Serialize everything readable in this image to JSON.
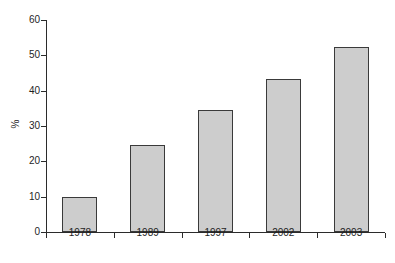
{
  "chart_data": {
    "type": "bar",
    "title": "",
    "subtitle": "",
    "xlabel": "",
    "ylabel": "%",
    "categories": [
      "1978",
      "1989",
      "1997",
      "2002",
      "2003"
    ],
    "values": [
      9.8,
      24.7,
      34.4,
      43.2,
      52.4
    ],
    "ylim": [
      0,
      60
    ],
    "ytick_values": [
      0,
      10,
      20,
      30,
      40,
      50,
      60
    ],
    "ytick_labels": [
      "0",
      "10",
      "20",
      "30",
      "40",
      "50",
      "60"
    ],
    "grid": false,
    "legend": null,
    "legend_position": "none",
    "bar_fill_color": "#cdcdcd",
    "bar_edge_color": "#3a3a3a",
    "axis_color": "#2b2b2b",
    "background_color": "#ffffff",
    "annotations": []
  }
}
